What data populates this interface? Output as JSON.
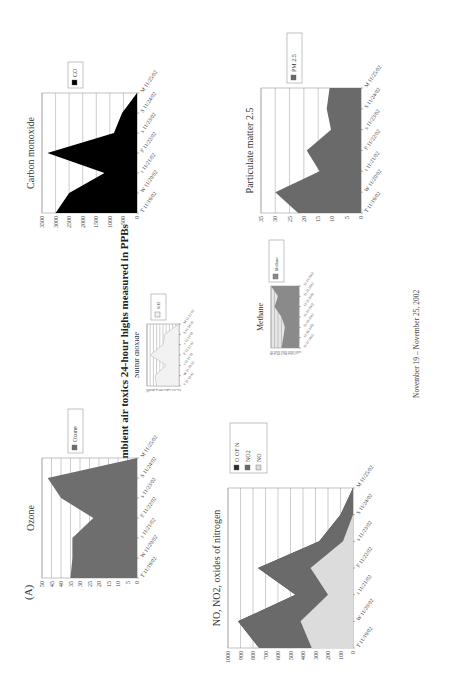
{
  "page": {
    "title": "Metro Dallas ambient air toxics 24-hour highs measured in PPBs",
    "panel_label": "(A)",
    "footer": "November 19 – November 25, 2002",
    "orientation": "rotated 90 degrees (landscape page)"
  },
  "colors": {
    "ozone": "#6e6e6e",
    "co": "#000000",
    "so2": "#f2f2f2",
    "methane_fill": "#8a8a8a",
    "methane_bg": "#e6e6e6",
    "pm25": "#6a6a6a",
    "no": "#dcdcdc",
    "no2": "#6a6a6a",
    "oofn": "#2b2b2b",
    "grid": "#9a9a9a"
  },
  "chart_data": [
    {
      "id": "ozone",
      "type": "area",
      "title": "Ozone",
      "categories": [
        "T 11/19/02",
        "W 11/20/02",
        "t 11/21/02",
        "F 11/22/02",
        "s 11/23/02",
        "S 11/24/02",
        "M 11/25/02"
      ],
      "series": [
        {
          "name": "Ozone",
          "values": [
            35,
            34,
            34,
            23,
            40,
            47,
            0
          ]
        }
      ],
      "yticks": [
        0,
        5,
        10,
        15,
        20,
        25,
        30,
        35,
        40,
        45,
        50
      ],
      "ylim": [
        0,
        50
      ],
      "grid": true,
      "legend": [
        "Ozone"
      ],
      "legend_position": "right"
    },
    {
      "id": "so2",
      "type": "area",
      "title": "Sulfur dioxide",
      "categories": [
        "T 11/19/02",
        "W 11/20/02",
        "t 11/21/02",
        "F 11/22/02",
        "s 11/23/02",
        "S 11/24/02",
        "M 11/25/02"
      ],
      "series": [
        {
          "name": "SO2",
          "values": [
            7,
            7.5,
            4,
            9,
            5,
            4.5,
            0
          ]
        }
      ],
      "yticks": [
        0,
        1,
        2,
        3,
        4,
        5,
        6,
        7,
        8,
        9,
        10
      ],
      "ylim": [
        0,
        10
      ],
      "grid": true,
      "legend": [
        "SO2"
      ],
      "legend_position": "right"
    },
    {
      "id": "co",
      "type": "area",
      "title": "Carbon monoxide",
      "categories": [
        "T 11/19/02",
        "W 11/20/02",
        "t 11/21/02",
        "F 11/22/02",
        "s 11/23/02",
        "S 11/24/02",
        "M 11/25/02"
      ],
      "series": [
        {
          "name": "CO",
          "values": [
            3000,
            2500,
            1200,
            3300,
            850,
            550,
            0
          ]
        }
      ],
      "yticks": [
        0,
        500,
        1000,
        1500,
        2000,
        2500,
        3000,
        3500
      ],
      "ylim": [
        0,
        3500
      ],
      "grid": true,
      "legend": [
        "CO"
      ],
      "legend_position": "right"
    },
    {
      "id": "nox",
      "type": "area",
      "title": "NO, NO2, oxides of nitrogen",
      "categories": [
        "T 11/19/02",
        "W 11/20/02",
        "t 11/21/02",
        "F 11/22/02",
        "s 11/23/02",
        "S 11/24/02",
        "M 11/25/02"
      ],
      "series": [
        {
          "name": "O OF N",
          "values": [
            750,
            920,
            460,
            760,
            270,
            100,
            0
          ]
        },
        {
          "name": "NO2",
          "values": [
            750,
            920,
            460,
            760,
            270,
            100,
            0
          ]
        },
        {
          "name": "NO",
          "values": [
            330,
            420,
            200,
            340,
            80,
            0,
            0
          ]
        }
      ],
      "yticks": [
        0,
        100,
        200,
        300,
        400,
        500,
        600,
        700,
        800,
        900,
        1000
      ],
      "ylim": [
        0,
        1000
      ],
      "grid": true,
      "legend": [
        "O OF N",
        "NO2",
        "NO"
      ],
      "legend_position": "right"
    },
    {
      "id": "methane",
      "type": "area",
      "title": "Methane",
      "categories": [
        "11/17/2002",
        "11/18/2002",
        "11/19/2002",
        "11/20/2002",
        "11/21/2002",
        "11/22/2002",
        "11/23/2002"
      ],
      "series": [
        {
          "name": "Methane",
          "values": [
            50,
            45,
            40,
            50,
            70,
            60,
            80
          ]
        }
      ],
      "yticks": [
        0,
        10,
        20,
        30,
        40,
        50,
        60,
        70,
        80
      ],
      "ylim": [
        0,
        80
      ],
      "grid": true,
      "legend": [
        "Methane"
      ],
      "legend_position": "right"
    },
    {
      "id": "pm25",
      "type": "area",
      "title": "Particulate matter 2.5",
      "categories": [
        "T 11/19/02",
        "W 11/20/02",
        "t 11/21/02",
        "F 11/22/02",
        "s 11/23/02",
        "S 11/24/02",
        "M 11/25/02"
      ],
      "series": [
        {
          "name": "PM 2.5",
          "values": [
            22,
            30,
            14.5,
            19,
            10.5,
            12,
            11
          ]
        }
      ],
      "yticks": [
        0,
        5,
        10,
        15,
        20,
        25,
        30,
        35
      ],
      "ylim": [
        0,
        35
      ],
      "grid": true,
      "legend": [
        "PM 2.5"
      ],
      "legend_position": "right"
    }
  ]
}
